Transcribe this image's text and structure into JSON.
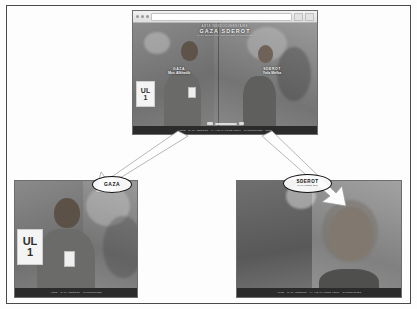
{
  "figure": {
    "background": "#ffffff",
    "border_color": "#4a4a4a"
  },
  "main_panel": {
    "name": "main-video-window",
    "browser": {
      "url_value": "",
      "url_placeholder": ""
    },
    "site_header": {
      "eyebrow": "ARTE WEBDOCUMENTAIRE",
      "title": "GAZA SDEROT",
      "tagline": "la vie malgre tout / life in spite of everything"
    },
    "left_feed": {
      "location": "GAZA",
      "person": "Mus Alkhatib",
      "role": ""
    },
    "right_feed": {
      "location": "SDEROT",
      "person": "Yafa Melka",
      "role": ""
    },
    "sign_text_line1": "UL",
    "sign_text_line2": "1",
    "footer_text": "ARTE  ·  GAZA SDEROT  ·  LA VIE MALGRE TOUT  ·  CHRONIQUES  ·  2008"
  },
  "callouts": [
    {
      "name": "callout-gaza",
      "title": "GAZA",
      "subtitle": ""
    },
    {
      "name": "callout-sderot",
      "title": "SDEROT",
      "subtitle": "la vie malgre tout"
    }
  ],
  "left_panel": {
    "name": "zoom-panel-gaza",
    "sign_text_line1": "UL",
    "sign_text_line2": "1",
    "footer_text": "ARTE  ·  GAZA SDEROT  ·  CHRONIQUES"
  },
  "right_panel": {
    "name": "zoom-panel-sderot",
    "footer_text": "ARTE  ·  GAZA SDEROT  ·  LA VIE MALGRE TOUT  ·  CHRONIQUES"
  },
  "colors": {
    "frame_border": "#6d6d6d",
    "video_bg": "#8e8e8e",
    "footer_bar": "#2b2b2b",
    "callout_stroke": "#111111",
    "arrow_fill": "#fefefe",
    "arrow_stroke": "#8a8a8a"
  }
}
